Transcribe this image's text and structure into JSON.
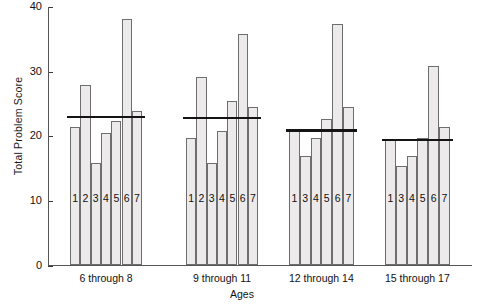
{
  "chart_data": {
    "type": "bar",
    "title": "",
    "xlabel": "Ages",
    "ylabel": "Total Problem Score",
    "ylim": [
      0,
      40
    ],
    "yticks": [
      0,
      10,
      20,
      30,
      40
    ],
    "ytick_labels": [
      "0",
      "10",
      "20",
      "30",
      "40"
    ],
    "grid": false,
    "legend": "none",
    "categories": [
      "6 through 8",
      "9 through 11",
      "12 through 14",
      "15 through 17"
    ],
    "groups": [
      {
        "label": "6 through 8",
        "mean_line": 23.0,
        "bars": [
          {
            "name": "1",
            "value": 21.4
          },
          {
            "name": "2",
            "value": 28.0
          },
          {
            "name": "3",
            "value": 15.8
          },
          {
            "name": "4",
            "value": 20.5
          },
          {
            "name": "5",
            "value": 22.4
          },
          {
            "name": "6",
            "value": 38.2
          },
          {
            "name": "7",
            "value": 23.9
          }
        ]
      },
      {
        "label": "9 through 11",
        "mean_line": 22.8,
        "bars": [
          {
            "name": "1",
            "value": 19.7
          },
          {
            "name": "2",
            "value": 29.1
          },
          {
            "name": "3",
            "value": 15.9
          },
          {
            "name": "4",
            "value": 20.8
          },
          {
            "name": "5",
            "value": 25.4
          },
          {
            "name": "6",
            "value": 35.8
          },
          {
            "name": "7",
            "value": 24.6
          }
        ]
      },
      {
        "label": "12 through 14",
        "mean_line": 20.9,
        "bars": [
          {
            "name": "1",
            "value": 21.1
          },
          {
            "name": "3",
            "value": 17.0
          },
          {
            "name": "4",
            "value": 19.8
          },
          {
            "name": "5",
            "value": 22.7
          },
          {
            "name": "6",
            "value": 37.3
          },
          {
            "name": "7",
            "value": 24.5
          }
        ]
      },
      {
        "label": "15 through 17",
        "mean_line": 19.4,
        "bars": [
          {
            "name": "1",
            "value": 19.5
          },
          {
            "name": "3",
            "value": 15.4
          },
          {
            "name": "4",
            "value": 17.0
          },
          {
            "name": "5",
            "value": 19.7
          },
          {
            "name": "6",
            "value": 30.8
          },
          {
            "name": "7",
            "value": 21.4
          }
        ]
      }
    ]
  },
  "colors": {
    "bar_fill": "#eceaea",
    "bar_stroke": "#6e6e6e",
    "mean_line": "#141414",
    "axis": "#555555",
    "text": "#111111"
  }
}
